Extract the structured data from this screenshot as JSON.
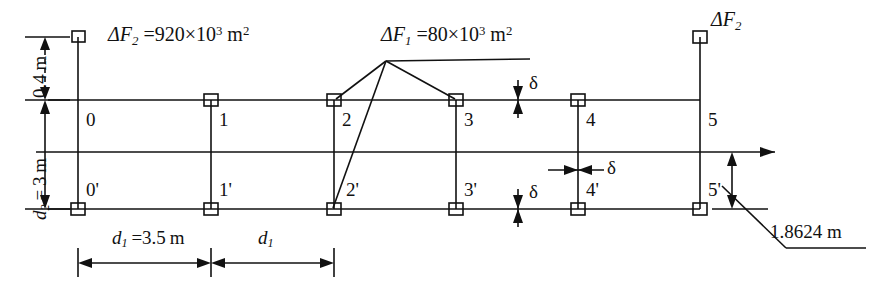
{
  "diagram": {
    "type": "structural-truss-schematic",
    "stroke_color": "#111111",
    "background": "#ffffff"
  },
  "annotations": {
    "delta_f2_left": {
      "symbol": "ΔF",
      "sub": "2",
      "equals": "=",
      "coefficient": "920",
      "times": "×",
      "base": "10",
      "exponent": "3",
      "unit": "m",
      "unit_exp": "2",
      "full_text": "ΔF2 =920×10^3 m^2"
    },
    "delta_f1_center": {
      "symbol": "ΔF",
      "sub": "1",
      "equals": "=",
      "coefficient": "80",
      "times": "×",
      "base": "10",
      "exponent": "3",
      "unit": "m",
      "unit_exp": "2",
      "full_text": "ΔF1 =80×10^3 m^2"
    },
    "delta_f2_right": {
      "symbol": "ΔF",
      "sub": "2",
      "full_text": "ΔF2"
    },
    "length_right": {
      "value": "1.8624",
      "unit": "m",
      "full_text": "1.8624 m"
    }
  },
  "dimensions": {
    "vertical_upper": {
      "value": "0.4",
      "unit": "m",
      "full_text": "0.4 m",
      "style": "dashed"
    },
    "vertical_lower": {
      "symbol": "d",
      "sub": "2",
      "equals": "=",
      "value": "3",
      "unit": "m",
      "full_text": "d2 = 3 m",
      "style": "solid"
    },
    "horizontal_first": {
      "symbol": "d",
      "sub": "1",
      "equals": "=",
      "value": "3.5",
      "unit": "m",
      "full_text": "d1 =3.5 m"
    },
    "horizontal_second": {
      "symbol": "d",
      "sub": "1",
      "full_text": "d1"
    }
  },
  "delta_markers": {
    "upper_chord": {
      "label": "δ",
      "orientation": "vertical"
    },
    "lower_chord": {
      "label": "δ",
      "orientation": "vertical"
    },
    "axis": {
      "label": "δ",
      "orientation": "horizontal"
    }
  },
  "nodes": {
    "upper_chord": [
      {
        "label": "0",
        "x": 78
      },
      {
        "label": "1",
        "x": 211
      },
      {
        "label": "2",
        "x": 334
      },
      {
        "label": "3",
        "x": 456
      },
      {
        "label": "4",
        "x": 578
      },
      {
        "label": "5",
        "x": 700
      }
    ],
    "lower_chord": [
      {
        "label": "0'",
        "x": 78
      },
      {
        "label": "1'",
        "x": 211
      },
      {
        "label": "2'",
        "x": 334
      },
      {
        "label": "3'",
        "x": 456
      },
      {
        "label": "4'",
        "x": 578
      },
      {
        "label": "5'",
        "x": 700
      }
    ]
  }
}
